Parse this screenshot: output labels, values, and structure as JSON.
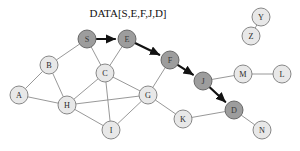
{
  "figure": {
    "title": "DATA[S,E,F,J,D]",
    "title_x": 128,
    "title_y": 17,
    "background": "#ffffff",
    "node_fill_plain": "#e8e8e8",
    "node_fill_highlight": "#9d9d9d",
    "node_stroke": "#7a7a7a",
    "edge_color": "#8c8c8c",
    "path_color": "#121212",
    "node_radius": 9
  },
  "chart_data": {
    "type": "diagram",
    "title": "DATA[S,E,F,J,D]",
    "subtype": "network-graph-routing",
    "nodes": [
      {
        "id": "A",
        "label": "A",
        "x": 19,
        "y": 95,
        "state": "plain"
      },
      {
        "id": "B",
        "label": "B",
        "x": 49,
        "y": 65,
        "state": "plain"
      },
      {
        "id": "C",
        "label": "C",
        "x": 105,
        "y": 73,
        "state": "plain"
      },
      {
        "id": "D",
        "label": "D",
        "x": 234,
        "y": 110,
        "state": "highlight"
      },
      {
        "id": "E",
        "label": "E",
        "x": 127,
        "y": 39,
        "state": "highlight"
      },
      {
        "id": "F",
        "label": "F",
        "x": 170,
        "y": 60,
        "state": "highlight"
      },
      {
        "id": "G",
        "label": "G",
        "x": 148,
        "y": 95,
        "state": "plain"
      },
      {
        "id": "H",
        "label": "H",
        "x": 67,
        "y": 105,
        "state": "plain"
      },
      {
        "id": "I",
        "label": "I",
        "x": 111,
        "y": 130,
        "state": "plain"
      },
      {
        "id": "J",
        "label": "J",
        "x": 203,
        "y": 81,
        "state": "highlight"
      },
      {
        "id": "K",
        "label": "K",
        "x": 183,
        "y": 119,
        "state": "plain"
      },
      {
        "id": "L",
        "label": "L",
        "x": 282,
        "y": 74,
        "state": "plain"
      },
      {
        "id": "M",
        "label": "M",
        "x": 243,
        "y": 74,
        "state": "plain"
      },
      {
        "id": "N",
        "label": "N",
        "x": 262,
        "y": 130,
        "state": "plain"
      },
      {
        "id": "S",
        "label": "S",
        "x": 87,
        "y": 39,
        "state": "highlight"
      },
      {
        "id": "Y",
        "label": "Y",
        "x": 261,
        "y": 17,
        "state": "plain"
      },
      {
        "id": "Z",
        "label": "Z",
        "x": 251,
        "y": 36,
        "state": "plain"
      }
    ],
    "edges": [
      {
        "from": "A",
        "to": "B"
      },
      {
        "from": "A",
        "to": "H"
      },
      {
        "from": "B",
        "to": "H"
      },
      {
        "from": "B",
        "to": "S"
      },
      {
        "from": "S",
        "to": "C"
      },
      {
        "from": "C",
        "to": "E"
      },
      {
        "from": "C",
        "to": "H"
      },
      {
        "from": "C",
        "to": "G"
      },
      {
        "from": "C",
        "to": "I"
      },
      {
        "from": "H",
        "to": "I"
      },
      {
        "from": "H",
        "to": "G"
      },
      {
        "from": "G",
        "to": "I"
      },
      {
        "from": "G",
        "to": "F"
      },
      {
        "from": "G",
        "to": "K"
      },
      {
        "from": "K",
        "to": "D"
      },
      {
        "from": "J",
        "to": "M"
      },
      {
        "from": "M",
        "to": "L"
      },
      {
        "from": "D",
        "to": "N"
      },
      {
        "from": "Y",
        "to": "Z"
      }
    ],
    "path_edges": [
      {
        "from": "S",
        "to": "E",
        "arrow": true
      },
      {
        "from": "E",
        "to": "F",
        "arrow": true
      },
      {
        "from": "F",
        "to": "J",
        "arrow": true
      },
      {
        "from": "J",
        "to": "D",
        "arrow": true
      }
    ],
    "path_sequence": [
      "S",
      "E",
      "F",
      "J",
      "D"
    ]
  }
}
